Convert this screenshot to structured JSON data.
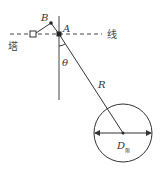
{
  "diagram": {
    "labels": {
      "point_b": "B",
      "point_a": "A",
      "line": "线",
      "tower": "塔",
      "angle": "θ",
      "radius": "R",
      "diameter": "D",
      "diameter_sub": "限"
    },
    "colors": {
      "stroke": "#333333",
      "background": "#ffffff"
    }
  }
}
